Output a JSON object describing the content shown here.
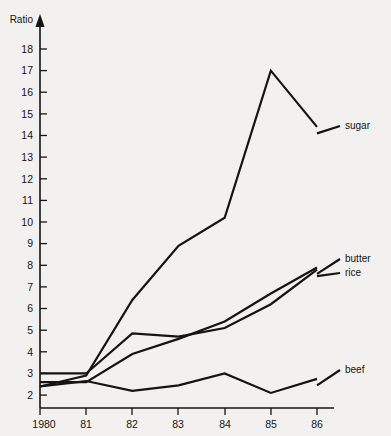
{
  "chart_data": {
    "type": "line",
    "title": "",
    "xlabel": "",
    "ylabel": "Ratio",
    "x": [
      1980,
      1981,
      1982,
      1983,
      1984,
      1985,
      1986
    ],
    "categories": [
      "1980",
      "81",
      "82",
      "83",
      "84",
      "85",
      "86"
    ],
    "xlim": [
      1980,
      1986
    ],
    "ylim": [
      1.2,
      18.6
    ],
    "y_ticks": [
      2,
      3,
      4,
      5,
      6,
      7,
      8,
      9,
      10,
      11,
      12,
      13,
      14,
      15,
      16,
      17,
      18
    ],
    "y_tick_labels": [
      "2",
      "3",
      "4",
      "5",
      "6",
      "7",
      "8",
      "9",
      "10",
      "11",
      "12",
      "13",
      "14",
      "15",
      "16",
      "17",
      "18"
    ],
    "grid": false,
    "legend_position": "right-inline-labels",
    "line_color": "#141414",
    "background_color": "#f2f1ef",
    "series": [
      {
        "name": "sugar",
        "label": "sugar",
        "values": [
          2.4,
          2.9,
          6.4,
          8.9,
          10.2,
          17.0,
          14.4
        ]
      },
      {
        "name": "butter",
        "label": "butter",
        "values": [
          2.6,
          2.6,
          3.9,
          4.6,
          5.4,
          6.7,
          7.9
        ]
      },
      {
        "name": "rice",
        "label": "rice",
        "values": [
          3.0,
          3.0,
          4.85,
          4.7,
          5.1,
          6.2,
          7.8
        ]
      },
      {
        "name": "beef",
        "label": "beef",
        "values": [
          2.4,
          2.65,
          2.2,
          2.45,
          3.0,
          2.1,
          2.75
        ]
      }
    ],
    "annotations": [
      {
        "name": "sugar",
        "text": "sugar",
        "x": 348,
        "y": 129
      },
      {
        "name": "butter",
        "text": "butter",
        "x": 345,
        "y": 262
      },
      {
        "name": "rice",
        "text": "rice",
        "x": 345,
        "y": 276
      },
      {
        "name": "beef",
        "text": "beef",
        "x": 345,
        "y": 373
      }
    ]
  }
}
